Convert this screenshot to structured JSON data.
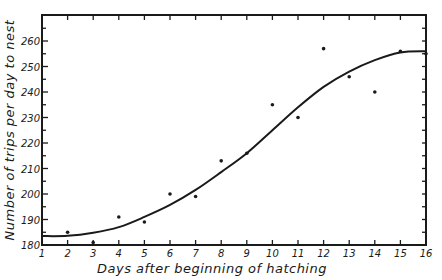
{
  "chart_data": {
    "type": "scatter",
    "title": "",
    "xlabel": "Days after beginning of hatching",
    "ylabel": "Number of trips per day to nest",
    "xlim": [
      1,
      16
    ],
    "ylim": [
      180,
      270
    ],
    "x_ticks": [
      1,
      2,
      3,
      4,
      5,
      6,
      7,
      8,
      9,
      10,
      11,
      12,
      13,
      14,
      15,
      16
    ],
    "y_ticks": [
      180,
      190,
      200,
      210,
      220,
      230,
      240,
      250,
      260
    ],
    "y_minor_step": 5,
    "grid": false,
    "legend": null,
    "series": [
      {
        "name": "Observed trips",
        "kind": "scatter",
        "x": [
          2,
          3,
          4,
          5,
          6,
          7,
          8,
          9,
          10,
          11,
          12,
          13,
          14,
          15,
          16
        ],
        "y": [
          185,
          181,
          191,
          189,
          200,
          199,
          213,
          216,
          235,
          230,
          257,
          246,
          240,
          256,
          255
        ]
      },
      {
        "name": "Fitted curve",
        "kind": "line",
        "x": [
          1,
          2,
          3,
          4,
          5,
          6,
          7,
          8,
          9,
          10,
          11,
          12,
          13,
          14,
          15,
          16
        ],
        "y": [
          183.5,
          183.6,
          184.8,
          187,
          191,
          195.7,
          201.6,
          208.6,
          216,
          225,
          234,
          242,
          248,
          252.5,
          255.5,
          256
        ]
      }
    ]
  },
  "colors": {
    "ink": "#1a1a1a",
    "background": "#ffffff"
  }
}
